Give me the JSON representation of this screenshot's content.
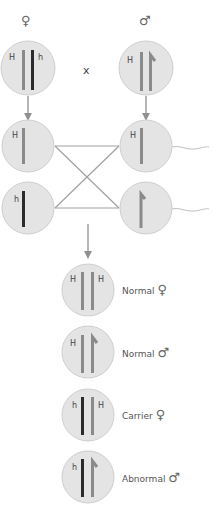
{
  "diagram": {
    "cross_symbol": "x",
    "colors": {
      "cell_fill": "#e4e4e4",
      "cell_stroke": "#cfcfcf",
      "normal_x": "#8a8a8a",
      "mutant_x": "#2b2b2b",
      "y_chromosome": "#8a8a8a",
      "arrow": "#8f8f8f",
      "cross_lines": "#a0a0a0"
    },
    "parents": {
      "female": {
        "symbol": "♀",
        "alleles": [
          "H",
          "h"
        ]
      },
      "male": {
        "symbol": "♂",
        "alleles": [
          "H",
          "Y"
        ],
        "allele_label": "H"
      }
    },
    "gametes": {
      "eggs": [
        {
          "allele": "H"
        },
        {
          "allele": "h"
        }
      ],
      "sperm": [
        {
          "allele": "H"
        },
        {
          "allele": "Y"
        }
      ]
    },
    "offspring": [
      {
        "alleles": [
          "H",
          "H"
        ],
        "left_label": "H",
        "right_label": "H",
        "status": "Normal",
        "sex": "♀"
      },
      {
        "alleles": [
          "H",
          "Y"
        ],
        "left_label": "H",
        "right_label": "",
        "status": "Normal",
        "sex": "♂"
      },
      {
        "alleles": [
          "h",
          "H"
        ],
        "left_label": "h",
        "right_label": "H",
        "status": "Carrier",
        "sex": "♀"
      },
      {
        "alleles": [
          "h",
          "Y"
        ],
        "left_label": "h",
        "right_label": "",
        "status": "Abnormal",
        "sex": "♂"
      }
    ]
  }
}
